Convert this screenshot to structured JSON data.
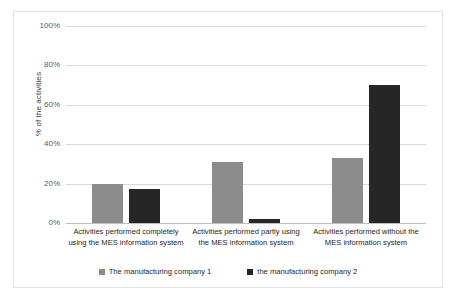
{
  "chart_data": {
    "type": "bar",
    "title": "",
    "xlabel": "",
    "ylabel": "% of the activities",
    "ylim": [
      0,
      100
    ],
    "ytick_labels": [
      "100%",
      "80%",
      "60%",
      "40%",
      "20%",
      "0%"
    ],
    "ytick_values": [
      100,
      80,
      60,
      40,
      20,
      0
    ],
    "grid": true,
    "legend_position": "bottom",
    "categories": [
      "Activities performed completely using the MES information system",
      "Activities performed partly using the MES information system",
      "Activities performed without the MES information system"
    ],
    "series": [
      {
        "name": "The manufacturing company 1",
        "color": "#8c8c8c",
        "values": [
          20,
          31,
          33
        ]
      },
      {
        "name": "the manufacturing company 2",
        "color": "#262626",
        "values": [
          17.5,
          2,
          70
        ]
      }
    ]
  },
  "colors": {
    "series_1": "#8c8c8c",
    "series_2": "#262626",
    "gridline": "#d9d9d9",
    "border": "#e4e4e4",
    "background": "#ffffff"
  }
}
